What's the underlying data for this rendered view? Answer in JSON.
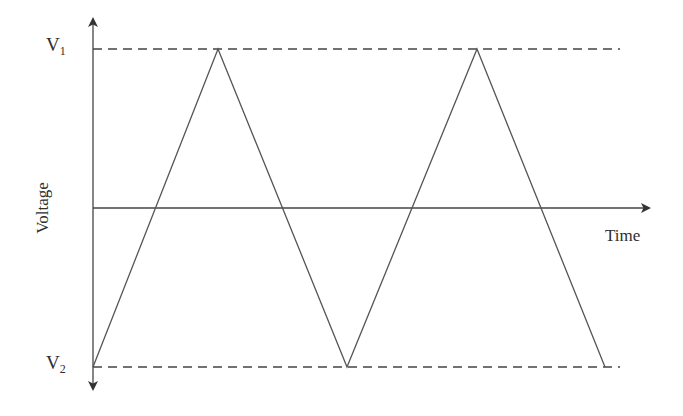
{
  "diagram": {
    "title": "",
    "type": "triangle-wave",
    "labels": {
      "v1_main": "V",
      "v1_sub": "1",
      "v2_main": "V",
      "v2_sub": "2",
      "x_axis": "Time",
      "y_axis": "Voltage"
    },
    "colors": {
      "line": "#555555",
      "axis": "#444444",
      "dash": "#444444",
      "background": "#ffffff"
    },
    "geometry": {
      "y_axis_x": 93,
      "y_axis_top": 18,
      "y_axis_bottom": 390,
      "x_axis_y": 208,
      "x_axis_end": 650,
      "v1_y": 49,
      "v2_y": 367,
      "dash_end_x": 620
    },
    "waveform_points": [
      {
        "x": 93,
        "y": 367,
        "level": "V2"
      },
      {
        "x": 218,
        "y": 49,
        "level": "V1"
      },
      {
        "x": 347,
        "y": 367,
        "level": "V2"
      },
      {
        "x": 477,
        "y": 49,
        "level": "V1"
      },
      {
        "x": 605,
        "y": 367,
        "level": "V2"
      }
    ]
  }
}
